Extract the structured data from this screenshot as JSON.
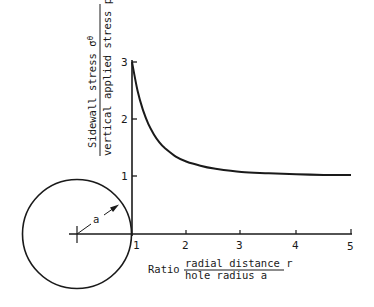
{
  "chart_data": {
    "type": "line",
    "title": "",
    "xlabel_prefix": "Ratio",
    "xlabel_numerator": "radial distance r",
    "xlabel_denominator": "hole radius a",
    "ylabel_numerator": "Sidewall stress σθ",
    "ylabel_denominator": "vertical applied stress pz",
    "xlim": [
      1,
      5
    ],
    "ylim": [
      0,
      3
    ],
    "x_ticks": [
      "1",
      "2",
      "3",
      "4",
      "5"
    ],
    "y_ticks": [
      "1",
      "2",
      "3"
    ],
    "grid": false,
    "legend": null,
    "series": [
      {
        "name": "sidewall stress ratio",
        "x": [
          1.0,
          1.1,
          1.2,
          1.3,
          1.4,
          1.5,
          1.6,
          1.8,
          2.0,
          2.25,
          2.5,
          3.0,
          3.5,
          4.0,
          4.5,
          5.0
        ],
        "y": [
          3.0,
          2.5,
          2.16,
          1.91,
          1.73,
          1.59,
          1.49,
          1.34,
          1.25,
          1.18,
          1.13,
          1.07,
          1.05,
          1.03,
          1.02,
          1.02
        ]
      }
    ],
    "annotations": [
      {
        "type": "circle",
        "label": "a",
        "description": "hole of radius a with radius arrow"
      }
    ]
  },
  "labels": {
    "y_top": "Sidewall stress σ",
    "y_top_sub": "θ",
    "y_bottom": "vertical applied stress p",
    "y_bottom_sub": "z",
    "x_prefix": "Ratio",
    "x_num": "radial distance r",
    "x_den": "hole radius a",
    "radius": "a",
    "xt1": "1",
    "xt2": "2",
    "xt3": "3",
    "xt4": "4",
    "xt5": "5",
    "yt1": "1",
    "yt2": "2",
    "yt3": "3"
  }
}
